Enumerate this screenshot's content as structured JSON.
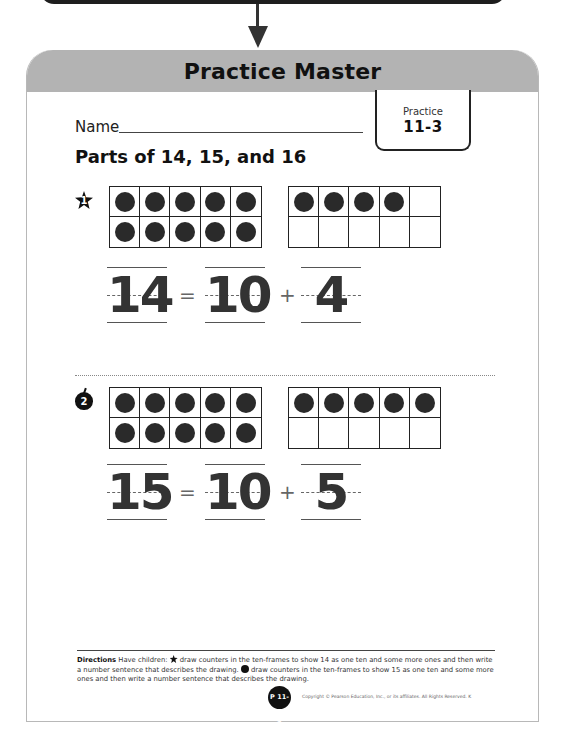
{
  "header": {
    "title": "Practice Master"
  },
  "worksheet": {
    "name_label": "Name",
    "practice_tab": {
      "label": "Practice",
      "number": "11-3"
    },
    "lesson_title": "Parts of 14, 15, and 16",
    "problems": [
      {
        "badge_icon": "star-icon",
        "badge_number": "1",
        "ten_frames": [
          {
            "filled": 10,
            "total": 10
          },
          {
            "filled": 4,
            "total": 10
          }
        ],
        "equation": {
          "total": "14",
          "equals": "=",
          "tens": "10",
          "plus": "+",
          "ones": "4"
        }
      },
      {
        "badge_icon": "apple-icon",
        "badge_number": "2",
        "ten_frames": [
          {
            "filled": 10,
            "total": 10
          },
          {
            "filled": 5,
            "total": 10
          }
        ],
        "equation": {
          "total": "15",
          "equals": "=",
          "tens": "10",
          "plus": "+",
          "ones": "5"
        }
      }
    ],
    "directions": {
      "label": "Directions",
      "part_intro": "Have children:",
      "part1": "draw counters in the ten-frames to show 14 as one ten and some more ones and then write a number sentence that describes the drawing.",
      "part2": "draw counters in the ten-frames to show 15 as one ten and some more ones and then write a number sentence that describes the drawing."
    },
    "footer": {
      "page_badge": "P 11-3",
      "copyright": "Copyright © Pearson Education, Inc., or its affiliates. All Rights Reserved. K"
    }
  },
  "colors": {
    "header_gray": "#b3b3b3",
    "counter": "#2a2a2a",
    "ink": "#111111"
  }
}
